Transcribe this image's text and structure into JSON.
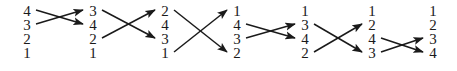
{
  "figure": {
    "kind": "permutation-transposition-diagram",
    "width": 457,
    "height": 71,
    "background_color": "#ffffff",
    "ink_color": "#1a1a1a",
    "row_count": 4,
    "column_count": 7,
    "row_y": [
      11,
      25,
      39,
      53
    ],
    "column_x": [
      27,
      93,
      165,
      237,
      305,
      372,
      433
    ]
  },
  "columns": [
    {
      "name": "column-1",
      "x": 27,
      "values": [
        "4",
        "3",
        "2",
        "1"
      ]
    },
    {
      "name": "column-2",
      "x": 93,
      "values": [
        "3",
        "4",
        "2",
        "1"
      ]
    },
    {
      "name": "column-3",
      "x": 165,
      "values": [
        "2",
        "4",
        "3",
        "1"
      ]
    },
    {
      "name": "column-4",
      "x": 237,
      "values": [
        "1",
        "4",
        "3",
        "2"
      ]
    },
    {
      "name": "column-5",
      "x": 305,
      "values": [
        "1",
        "3",
        "4",
        "2"
      ]
    },
    {
      "name": "column-6",
      "x": 372,
      "values": [
        "1",
        "2",
        "4",
        "3"
      ]
    },
    {
      "name": "column-7",
      "x": 433,
      "values": [
        "1",
        "2",
        "3",
        "4"
      ]
    }
  ],
  "transitions": [
    {
      "name": "swap-1",
      "from_column": 0,
      "to_column": 1,
      "swap_rows": [
        0,
        1
      ],
      "arrows": [
        {
          "from_row": 0,
          "to_row": 1
        },
        {
          "from_row": 1,
          "to_row": 0
        }
      ]
    },
    {
      "name": "swap-2",
      "from_column": 1,
      "to_column": 2,
      "swap_rows": [
        0,
        2
      ],
      "arrows": [
        {
          "from_row": 0,
          "to_row": 2
        },
        {
          "from_row": 2,
          "to_row": 0
        }
      ]
    },
    {
      "name": "swap-3",
      "from_column": 2,
      "to_column": 3,
      "swap_rows": [
        0,
        3
      ],
      "arrows": [
        {
          "from_row": 0,
          "to_row": 3
        },
        {
          "from_row": 3,
          "to_row": 0
        }
      ]
    },
    {
      "name": "swap-4",
      "from_column": 3,
      "to_column": 4,
      "swap_rows": [
        1,
        2
      ],
      "arrows": [
        {
          "from_row": 1,
          "to_row": 2
        },
        {
          "from_row": 2,
          "to_row": 1
        }
      ]
    },
    {
      "name": "swap-5",
      "from_column": 4,
      "to_column": 5,
      "swap_rows": [
        1,
        3
      ],
      "arrows": [
        {
          "from_row": 1,
          "to_row": 3
        },
        {
          "from_row": 3,
          "to_row": 1
        }
      ]
    },
    {
      "name": "swap-6",
      "from_column": 5,
      "to_column": 6,
      "swap_rows": [
        2,
        3
      ],
      "arrows": [
        {
          "from_row": 2,
          "to_row": 3
        },
        {
          "from_row": 3,
          "to_row": 2
        }
      ]
    }
  ]
}
